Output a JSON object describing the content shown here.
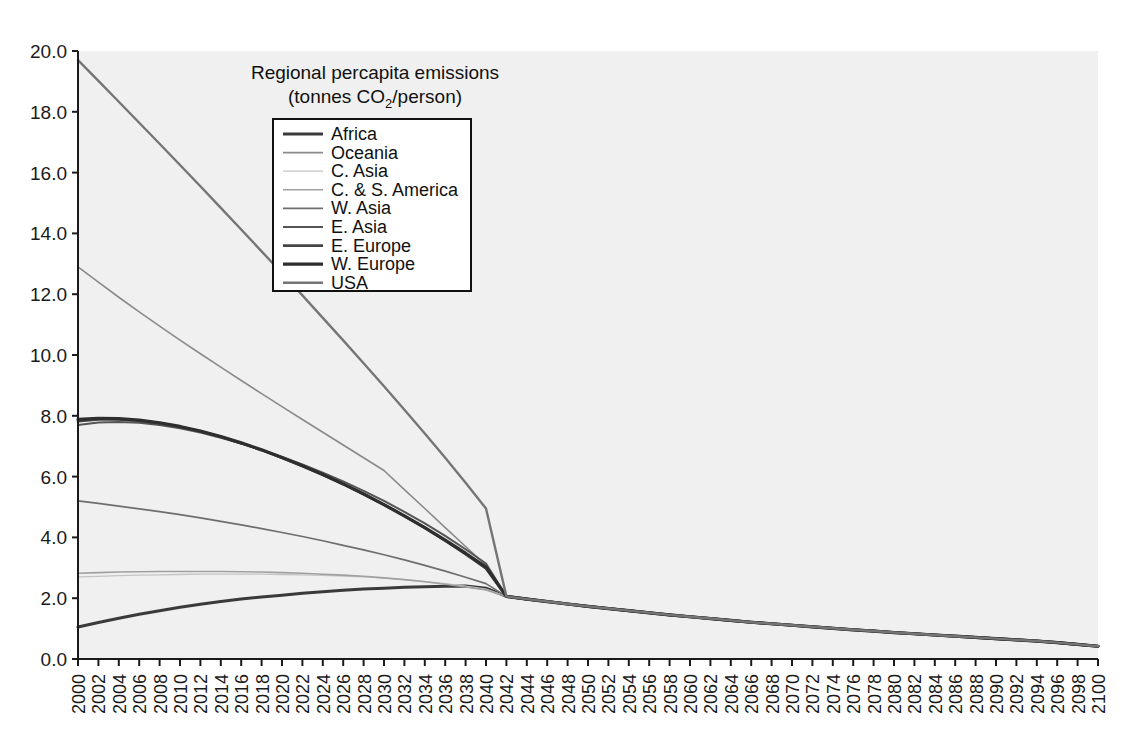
{
  "chart_data": {
    "type": "line",
    "title": "Regional percapita emissions",
    "subtitle_prefix": "(tonnes CO",
    "subtitle_sub": "2",
    "subtitle_suffix": "/person)",
    "xlabel": "",
    "ylabel": "",
    "grid": false,
    "legend_position": "top-center-inside",
    "xlim": [
      2000,
      2100
    ],
    "ylim": [
      0.0,
      20.0
    ],
    "ytick_step": 2.0,
    "ytick_labels": [
      "0.0",
      "2.0",
      "4.0",
      "6.0",
      "8.0",
      "10.0",
      "12.0",
      "14.0",
      "16.0",
      "18.0",
      "20.0"
    ],
    "ytick_values": [
      0,
      2,
      4,
      6,
      8,
      10,
      12,
      14,
      16,
      18,
      20
    ],
    "xtick_labels": [
      "2000",
      "2002",
      "2004",
      "2006",
      "2008",
      "2010",
      "2012",
      "2014",
      "2016",
      "2018",
      "2020",
      "2022",
      "2024",
      "2026",
      "2028",
      "2030",
      "2032",
      "2034",
      "2036",
      "2038",
      "2040",
      "2042",
      "2044",
      "2046",
      "2048",
      "2050",
      "2052",
      "2054",
      "2056",
      "2058",
      "2060",
      "2062",
      "2064",
      "2066",
      "2068",
      "2070",
      "2072",
      "2074",
      "2076",
      "2078",
      "2080",
      "2082",
      "2084",
      "2086",
      "2088",
      "2090",
      "2092",
      "2094",
      "2096",
      "2098",
      "2100"
    ],
    "x": [
      2000,
      2002,
      2004,
      2006,
      2008,
      2010,
      2012,
      2014,
      2016,
      2018,
      2020,
      2022,
      2024,
      2026,
      2028,
      2030,
      2032,
      2034,
      2036,
      2038,
      2040,
      2042,
      2044,
      2046,
      2048,
      2050,
      2052,
      2054,
      2056,
      2058,
      2060,
      2062,
      2064,
      2066,
      2068,
      2070,
      2072,
      2074,
      2076,
      2078,
      2080,
      2082,
      2084,
      2086,
      2088,
      2090,
      2092,
      2094,
      2096,
      2098,
      2100
    ],
    "convergence_year": 2041,
    "convergence_value": 2.1,
    "series": [
      {
        "name": "Africa",
        "color": "#3a3a3a",
        "width": 3.0,
        "values": [
          1.05,
          1.2,
          1.34,
          1.47,
          1.59,
          1.7,
          1.8,
          1.89,
          1.97,
          2.04,
          2.1,
          2.16,
          2.21,
          2.26,
          2.3,
          2.33,
          2.36,
          2.38,
          2.39,
          2.4,
          2.33,
          2.06,
          1.97,
          1.89,
          1.81,
          1.73,
          1.66,
          1.59,
          1.52,
          1.45,
          1.39,
          1.33,
          1.27,
          1.21,
          1.16,
          1.11,
          1.06,
          1.01,
          0.96,
          0.92,
          0.87,
          0.83,
          0.79,
          0.75,
          0.71,
          0.67,
          0.63,
          0.59,
          0.54,
          0.48,
          0.42
        ]
      },
      {
        "name": "Oceania",
        "color": "#8a8a8a",
        "width": 1.6,
        "values": [
          12.9,
          12.4,
          11.9,
          11.42,
          10.95,
          10.49,
          10.04,
          9.6,
          9.16,
          8.73,
          8.3,
          7.88,
          7.46,
          7.04,
          6.62,
          6.2,
          5.57,
          4.95,
          4.32,
          3.7,
          3.08,
          2.06,
          1.97,
          1.89,
          1.81,
          1.73,
          1.66,
          1.59,
          1.52,
          1.45,
          1.39,
          1.33,
          1.27,
          1.21,
          1.16,
          1.11,
          1.06,
          1.01,
          0.96,
          0.92,
          0.87,
          0.83,
          0.79,
          0.75,
          0.71,
          0.67,
          0.63,
          0.59,
          0.54,
          0.48,
          0.42
        ]
      },
      {
        "name": "C. Asia",
        "color": "#c4c4c4",
        "width": 1.3,
        "values": [
          2.7,
          2.72,
          2.74,
          2.76,
          2.77,
          2.78,
          2.79,
          2.79,
          2.79,
          2.79,
          2.78,
          2.77,
          2.75,
          2.73,
          2.7,
          2.66,
          2.61,
          2.55,
          2.48,
          2.4,
          2.3,
          2.06,
          1.97,
          1.89,
          1.81,
          1.73,
          1.66,
          1.59,
          1.52,
          1.45,
          1.39,
          1.33,
          1.27,
          1.21,
          1.16,
          1.11,
          1.06,
          1.01,
          0.96,
          0.92,
          0.87,
          0.83,
          0.79,
          0.75,
          0.71,
          0.67,
          0.63,
          0.59,
          0.54,
          0.48,
          0.42
        ]
      },
      {
        "name": "C. & S. America",
        "color": "#a0a0a0",
        "width": 1.6,
        "values": [
          2.82,
          2.84,
          2.86,
          2.87,
          2.88,
          2.88,
          2.88,
          2.88,
          2.87,
          2.86,
          2.84,
          2.82,
          2.79,
          2.76,
          2.72,
          2.67,
          2.61,
          2.54,
          2.46,
          2.37,
          2.27,
          2.06,
          1.97,
          1.89,
          1.81,
          1.73,
          1.66,
          1.59,
          1.52,
          1.45,
          1.39,
          1.33,
          1.27,
          1.21,
          1.16,
          1.11,
          1.06,
          1.01,
          0.96,
          0.92,
          0.87,
          0.83,
          0.79,
          0.75,
          0.71,
          0.67,
          0.63,
          0.59,
          0.54,
          0.48,
          0.42
        ]
      },
      {
        "name": "W. Asia",
        "color": "#6e6e6e",
        "width": 1.7,
        "values": [
          5.2,
          5.12,
          5.03,
          4.94,
          4.85,
          4.75,
          4.64,
          4.53,
          4.41,
          4.29,
          4.16,
          4.03,
          3.89,
          3.74,
          3.59,
          3.43,
          3.26,
          3.08,
          2.89,
          2.69,
          2.48,
          2.06,
          1.97,
          1.89,
          1.81,
          1.73,
          1.66,
          1.59,
          1.52,
          1.45,
          1.39,
          1.33,
          1.27,
          1.21,
          1.16,
          1.11,
          1.06,
          1.01,
          0.96,
          0.92,
          0.87,
          0.83,
          0.79,
          0.75,
          0.71,
          0.67,
          0.63,
          0.59,
          0.54,
          0.48,
          0.42
        ]
      },
      {
        "name": "E. Asia",
        "color": "#555555",
        "width": 2.0,
        "values": [
          7.7,
          7.78,
          7.8,
          7.77,
          7.7,
          7.59,
          7.45,
          7.28,
          7.09,
          6.88,
          6.65,
          6.4,
          6.13,
          5.84,
          5.53,
          5.2,
          4.84,
          4.46,
          4.05,
          3.61,
          3.14,
          2.06,
          1.97,
          1.89,
          1.81,
          1.73,
          1.66,
          1.59,
          1.52,
          1.45,
          1.39,
          1.33,
          1.27,
          1.21,
          1.16,
          1.11,
          1.06,
          1.01,
          0.96,
          0.92,
          0.87,
          0.83,
          0.79,
          0.75,
          0.71,
          0.67,
          0.63,
          0.59,
          0.54,
          0.48,
          0.42
        ]
      },
      {
        "name": "E. Europe",
        "color": "#444444",
        "width": 2.6,
        "values": [
          7.82,
          7.88,
          7.88,
          7.84,
          7.76,
          7.64,
          7.49,
          7.31,
          7.1,
          6.87,
          6.62,
          6.35,
          6.06,
          5.75,
          5.42,
          5.07,
          4.7,
          4.31,
          3.89,
          3.45,
          2.98,
          2.06,
          1.97,
          1.89,
          1.81,
          1.73,
          1.66,
          1.59,
          1.52,
          1.45,
          1.39,
          1.33,
          1.27,
          1.21,
          1.16,
          1.11,
          1.06,
          1.01,
          0.96,
          0.92,
          0.87,
          0.83,
          0.79,
          0.75,
          0.71,
          0.67,
          0.63,
          0.59,
          0.54,
          0.48,
          0.42
        ]
      },
      {
        "name": "W. Europe",
        "color": "#2e2e2e",
        "width": 3.2,
        "values": [
          7.88,
          7.92,
          7.91,
          7.86,
          7.77,
          7.65,
          7.5,
          7.32,
          7.11,
          6.88,
          6.63,
          6.36,
          6.07,
          5.76,
          5.43,
          5.08,
          4.71,
          4.32,
          3.91,
          3.48,
          3.02,
          2.06,
          1.97,
          1.89,
          1.81,
          1.73,
          1.66,
          1.59,
          1.52,
          1.45,
          1.39,
          1.33,
          1.27,
          1.21,
          1.16,
          1.11,
          1.06,
          1.01,
          0.96,
          0.92,
          0.87,
          0.83,
          0.79,
          0.75,
          0.71,
          0.67,
          0.63,
          0.59,
          0.54,
          0.48,
          0.42
        ]
      },
      {
        "name": "USA",
        "color": "#757575",
        "width": 2.4,
        "values": [
          19.7,
          19.02,
          18.33,
          17.64,
          16.95,
          16.25,
          15.55,
          14.84,
          14.13,
          13.41,
          12.69,
          11.96,
          11.22,
          10.48,
          9.73,
          8.97,
          8.2,
          7.42,
          6.62,
          5.8,
          4.95,
          2.06,
          1.97,
          1.89,
          1.81,
          1.73,
          1.66,
          1.59,
          1.52,
          1.45,
          1.39,
          1.33,
          1.27,
          1.21,
          1.16,
          1.11,
          1.06,
          1.01,
          0.96,
          0.92,
          0.87,
          0.83,
          0.79,
          0.75,
          0.71,
          0.67,
          0.63,
          0.59,
          0.54,
          0.48,
          0.42
        ]
      }
    ]
  },
  "colors": {
    "plot_background": "#f0f0f0",
    "page_background": "#ffffff",
    "axis": "#1a1a1a",
    "legend_border": "#111111"
  }
}
